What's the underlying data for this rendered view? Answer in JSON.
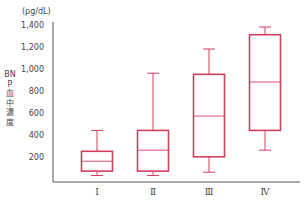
{
  "chart_data": {
    "type": "box",
    "title": "",
    "xlabel": "",
    "ylabel": "BNP血中濃度",
    "unit": "(pg/dL)",
    "ylim": [
      0,
      1400
    ],
    "yticks": [
      200,
      400,
      600,
      800,
      1000,
      1200,
      1400
    ],
    "ytick_labels": [
      "200",
      "400",
      "600",
      "800",
      "1,000",
      "1,200",
      "1,400"
    ],
    "categories": [
      "I",
      "II",
      "III",
      "IV"
    ],
    "category_display": [
      "Ⅰ",
      "Ⅱ",
      "Ⅲ",
      "Ⅳ"
    ],
    "boxes": [
      {
        "category": "I",
        "min": 50,
        "q1": 90,
        "median": 180,
        "q3": 270,
        "max": 460
      },
      {
        "category": "II",
        "min": 50,
        "q1": 90,
        "median": 280,
        "q3": 460,
        "max": 980
      },
      {
        "category": "III",
        "min": 80,
        "q1": 220,
        "median": 590,
        "q3": 970,
        "max": 1200
      },
      {
        "category": "IV",
        "min": 280,
        "q1": 460,
        "median": 900,
        "q3": 1330,
        "max": 1400
      }
    ],
    "grid": false,
    "legend": null,
    "colors": {
      "box": "#d0405e",
      "axis": "#555555",
      "text": "#444444"
    }
  },
  "labels": {
    "unit": "(pg/dL)",
    "ylabel": "BNP血中濃度"
  }
}
